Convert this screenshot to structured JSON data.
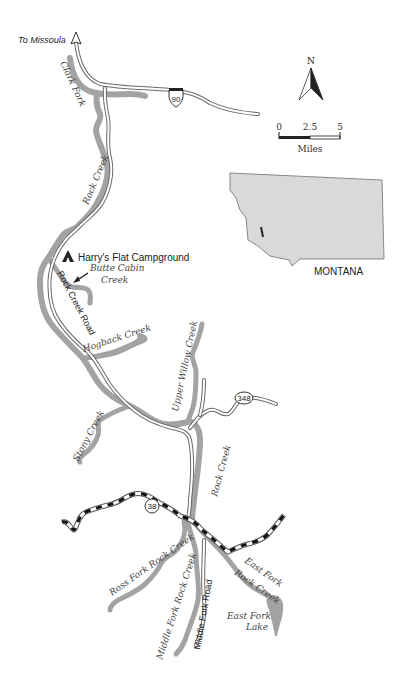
{
  "map": {
    "directional": {
      "to_missoula": "To Missoula"
    },
    "highways": {
      "interstate": "90",
      "route_348": "348",
      "route_38": "38"
    },
    "compass": {
      "north": "N"
    },
    "scale_bar": {
      "tick_0": "0",
      "tick_mid": "2.5",
      "tick_end": "5",
      "unit": "Miles"
    },
    "inset": {
      "state_label": "MONTANA"
    },
    "campground": {
      "label": "Harry's Flat Campground"
    },
    "roads": {
      "rock_creek_road": "Rock Creek Road",
      "middle_fork_road": "Middle Fork Road"
    },
    "waterways": {
      "clark_fork": "Clark Fork",
      "rock_creek_upper": "Rock Creek",
      "rock_creek_lower": "Rock Creek",
      "butte_cabin_line1": "Butte Cabin",
      "butte_cabin_line2": "Creek",
      "hogback": "Hogback Creek",
      "upper_willow": "Upper Willow Creek",
      "stony": "Stony Creek",
      "ross_fork": "Ross Fork Rock Creek",
      "middle_fork": "Middle Fork Rock Creek",
      "east_fork_line1": "East Fork",
      "east_fork_line2": "Rock Creek",
      "east_fork_lake_line1": "East Fork",
      "east_fork_lake_line2": "Lake"
    },
    "colors": {
      "river": "#a3a3a3",
      "road": "#6a6a6a",
      "state_fill": "#d9d9d9",
      "text": "#333333"
    }
  }
}
